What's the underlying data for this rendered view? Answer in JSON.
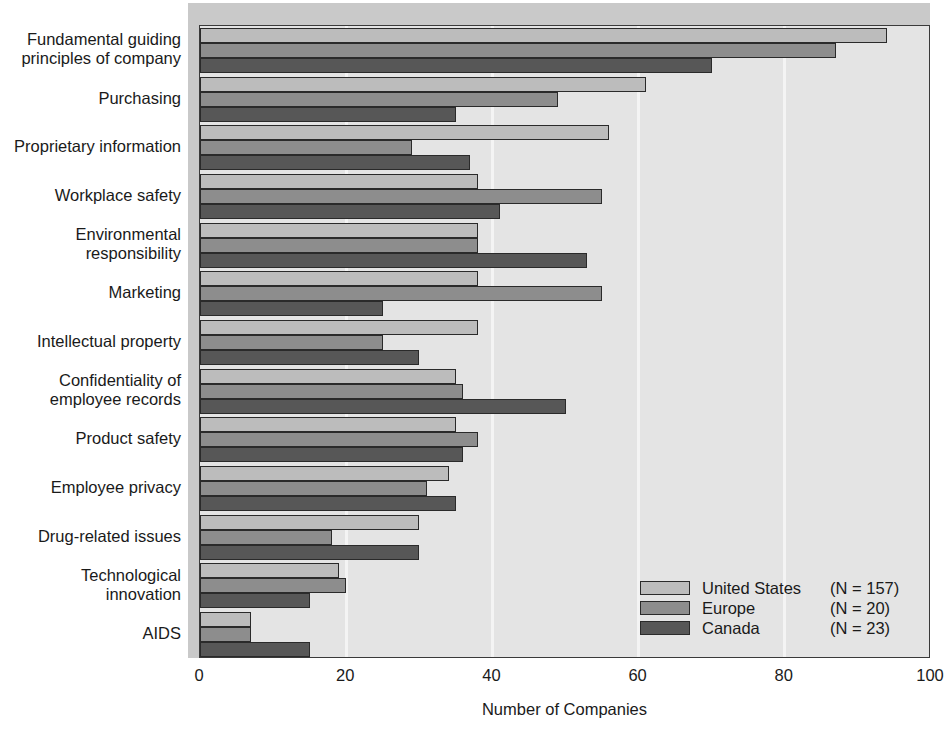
{
  "chart_data": {
    "type": "bar",
    "orientation": "horizontal",
    "title": "",
    "xlabel": "Number of Companies",
    "ylabel": "",
    "xlim": [
      0,
      100
    ],
    "xticks": [
      0,
      20,
      40,
      60,
      80,
      100
    ],
    "grid": true,
    "grid_axis": "x",
    "legend_position": "inside-lower-right",
    "categories": [
      "Fundamental guiding\nprinciples of company",
      "Purchasing",
      "Proprietary information",
      "Workplace safety",
      "Environmental\nresponsibility",
      "Marketing",
      "Intellectual property",
      "Confidentiality of\nemployee records",
      "Product safety",
      "Employee privacy",
      "Drug-related issues",
      "Technological\ninnovation",
      "AIDS"
    ],
    "series": [
      {
        "name": "United States",
        "n_label": "(N = 157)",
        "color": "#bcbcbc",
        "values": [
          94,
          61,
          56,
          38,
          38,
          38,
          38,
          35,
          35,
          34,
          30,
          19,
          7
        ]
      },
      {
        "name": "Europe",
        "n_label": "(N = 20)",
        "color": "#8d8d8d",
        "values": [
          87,
          49,
          29,
          55,
          38,
          55,
          25,
          36,
          38,
          31,
          18,
          20,
          7
        ]
      },
      {
        "name": "Canada",
        "n_label": "(N = 23)",
        "color": "#575757",
        "values": [
          70,
          35,
          37,
          41,
          53,
          25,
          30,
          50,
          36,
          35,
          30,
          15,
          15
        ]
      }
    ]
  },
  "axis": {
    "tick_labels": [
      "0",
      "20",
      "40",
      "60",
      "80",
      "100"
    ],
    "x_title": "Number of Companies"
  },
  "legend": {
    "entries": [
      {
        "label": "United States",
        "n": "(N = 157)"
      },
      {
        "label": "Europe",
        "n": "(N = 20)"
      },
      {
        "label": "Canada",
        "n": "(N = 23)"
      }
    ]
  },
  "colors": {
    "series_us": "#bcbcbc",
    "series_europe": "#8d8d8d",
    "series_canada": "#575757",
    "plot_background": "#e4e4e4",
    "gridline": "#f4f4f4",
    "axis": "#3a3a3a"
  }
}
